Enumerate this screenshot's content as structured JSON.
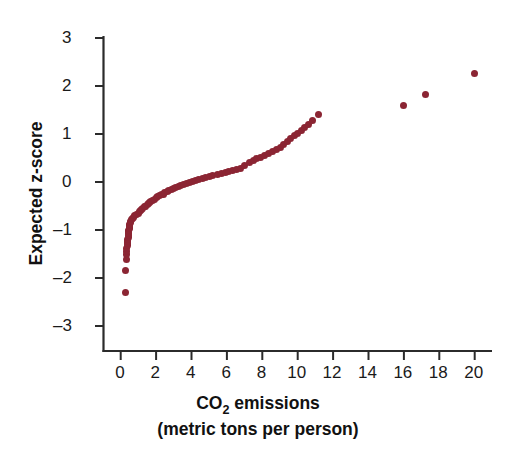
{
  "chart_data": {
    "type": "scatter",
    "title": "",
    "xlabel": "CO2 emissions (metric tons per person)",
    "ylabel": "Expected z-score",
    "xlim": [
      -0.9,
      21.0
    ],
    "ylim": [
      -3.6,
      3.4
    ],
    "xticks": [
      0,
      2,
      4,
      6,
      8,
      10,
      12,
      14,
      16,
      18,
      20
    ],
    "yticks": [
      -3,
      -2,
      -1,
      0,
      1,
      2,
      3
    ],
    "grid": false,
    "legend": null,
    "marker_color": "#8B2533",
    "marker_size_px": 7,
    "series": [
      {
        "name": "Normal probability plot",
        "points": [
          [
            0.25,
            -2.3
          ],
          [
            0.28,
            -1.84
          ],
          [
            0.3,
            -1.62
          ],
          [
            0.32,
            -1.52
          ],
          [
            0.34,
            -1.45
          ],
          [
            0.35,
            -1.39
          ],
          [
            0.37,
            -1.33
          ],
          [
            0.38,
            -1.28
          ],
          [
            0.39,
            -1.23
          ],
          [
            0.4,
            -1.19
          ],
          [
            0.42,
            -1.15
          ],
          [
            0.43,
            -1.11
          ],
          [
            0.44,
            -1.07
          ],
          [
            0.45,
            -1.03
          ],
          [
            0.46,
            -1.0
          ],
          [
            0.48,
            -0.97
          ],
          [
            0.49,
            -0.94
          ],
          [
            0.5,
            -0.91
          ],
          [
            0.52,
            -0.88
          ],
          [
            0.54,
            -0.85
          ],
          [
            0.56,
            -0.82
          ],
          [
            0.6,
            -0.79
          ],
          [
            0.65,
            -0.76
          ],
          [
            0.72,
            -0.73
          ],
          [
            0.8,
            -0.7
          ],
          [
            0.9,
            -0.68
          ],
          [
            1.0,
            -0.65
          ],
          [
            1.05,
            -0.62
          ],
          [
            1.1,
            -0.6
          ],
          [
            1.18,
            -0.57
          ],
          [
            1.25,
            -0.55
          ],
          [
            1.32,
            -0.52
          ],
          [
            1.4,
            -0.5
          ],
          [
            1.5,
            -0.47
          ],
          [
            1.58,
            -0.45
          ],
          [
            1.62,
            -0.43
          ],
          [
            1.7,
            -0.4
          ],
          [
            1.8,
            -0.38
          ],
          [
            1.9,
            -0.36
          ],
          [
            2.0,
            -0.33
          ],
          [
            2.1,
            -0.31
          ],
          [
            2.2,
            -0.29
          ],
          [
            2.3,
            -0.27
          ],
          [
            2.4,
            -0.25
          ],
          [
            2.5,
            -0.22
          ],
          [
            2.62,
            -0.2
          ],
          [
            2.72,
            -0.18
          ],
          [
            2.85,
            -0.16
          ],
          [
            3.0,
            -0.14
          ],
          [
            3.1,
            -0.12
          ],
          [
            3.25,
            -0.1
          ],
          [
            3.4,
            -0.07
          ],
          [
            3.55,
            -0.05
          ],
          [
            3.7,
            -0.03
          ],
          [
            3.9,
            -0.01
          ],
          [
            4.05,
            0.01
          ],
          [
            4.2,
            0.03
          ],
          [
            4.4,
            0.05
          ],
          [
            4.6,
            0.07
          ],
          [
            4.8,
            0.1
          ],
          [
            5.0,
            0.12
          ],
          [
            5.2,
            0.14
          ],
          [
            5.45,
            0.16
          ],
          [
            5.7,
            0.18
          ],
          [
            5.9,
            0.2
          ],
          [
            6.1,
            0.22
          ],
          [
            6.3,
            0.25
          ],
          [
            6.55,
            0.27
          ],
          [
            6.75,
            0.29
          ],
          [
            7.0,
            0.35
          ],
          [
            7.25,
            0.4
          ],
          [
            7.5,
            0.44
          ],
          [
            7.7,
            0.48
          ],
          [
            7.9,
            0.52
          ],
          [
            8.1,
            0.56
          ],
          [
            8.35,
            0.6
          ],
          [
            8.55,
            0.63
          ],
          [
            8.8,
            0.67
          ],
          [
            9.0,
            0.72
          ],
          [
            9.2,
            0.78
          ],
          [
            9.4,
            0.84
          ],
          [
            9.6,
            0.9
          ],
          [
            9.8,
            0.96
          ],
          [
            10.0,
            1.02
          ],
          [
            10.2,
            1.08
          ],
          [
            10.4,
            1.14
          ],
          [
            10.6,
            1.2
          ],
          [
            10.85,
            1.28
          ],
          [
            11.2,
            1.4
          ],
          [
            16.0,
            1.6
          ],
          [
            17.2,
            1.82
          ],
          [
            20.0,
            2.27
          ]
        ]
      }
    ],
    "axis_color": "#2b2b2b"
  },
  "axes": {
    "y_title_text": "Expected z-score",
    "x_title_line1_pre": "CO",
    "x_title_line1_sub": "2",
    "x_title_line1_post": " emissions",
    "x_title_line2": "(metric tons per person)",
    "x_tick_labels": [
      "0",
      "2",
      "4",
      "6",
      "8",
      "10",
      "12",
      "14",
      "16",
      "18",
      "20"
    ],
    "y_tick_labels": [
      "3",
      "2",
      "1",
      "0",
      "–1",
      "–2",
      "–3"
    ]
  }
}
